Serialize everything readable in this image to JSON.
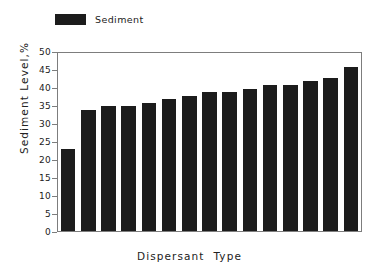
{
  "legend": {
    "entries": [
      {
        "label": "Sediment",
        "color": "#1c1c1c",
        "icon": "legend-swatch"
      }
    ]
  },
  "axes": {
    "y_title": "Sediment  Level,%",
    "x_title": "Dispersant  Type",
    "y_ticks": [
      "0",
      "5",
      "10",
      "15",
      "20",
      "25",
      "30",
      "35",
      "40",
      "45",
      "50"
    ]
  },
  "chart_data": {
    "type": "bar",
    "title": "",
    "subtitle": "",
    "xlabel": "Dispersant  Type",
    "ylabel": "Sediment  Level,%",
    "ylim": [
      0,
      50
    ],
    "ytick_values": [
      0,
      5,
      10,
      15,
      20,
      25,
      30,
      35,
      40,
      45,
      50
    ],
    "grid": false,
    "legend_position": "top-left",
    "categories": [
      "1",
      "2",
      "3",
      "4",
      "5",
      "6",
      "7",
      "8",
      "9",
      "10",
      "11",
      "12",
      "13",
      "14",
      "15"
    ],
    "xtick_labels_shown": false,
    "series": [
      {
        "name": "Sediment",
        "color": "#1c1c1c",
        "values": [
          23,
          34,
          35,
          35,
          36,
          37,
          38,
          39,
          39,
          40,
          41,
          41,
          42,
          43,
          46
        ]
      }
    ]
  }
}
